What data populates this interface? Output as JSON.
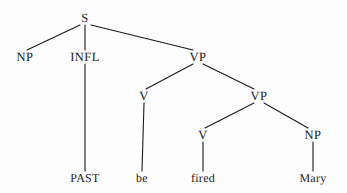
{
  "diagram": {
    "type": "syntax-tree",
    "canvas": {
      "width": 347,
      "height": 193,
      "background": "#fdfdfd"
    },
    "ink_color": "#1b1b1b",
    "nodes": [
      {
        "id": "s",
        "label": "S",
        "x": 85,
        "y": 18,
        "kind": "category"
      },
      {
        "id": "np1",
        "label": "NP",
        "x": 25,
        "y": 57,
        "kind": "category"
      },
      {
        "id": "infl",
        "label": "INFL",
        "x": 85,
        "y": 57,
        "kind": "category"
      },
      {
        "id": "vp1",
        "label": "VP",
        "x": 198,
        "y": 57,
        "kind": "category"
      },
      {
        "id": "v1",
        "label": "V",
        "x": 144,
        "y": 96,
        "kind": "category"
      },
      {
        "id": "vp2",
        "label": "VP",
        "x": 259,
        "y": 96,
        "kind": "category"
      },
      {
        "id": "v2",
        "label": "V",
        "x": 203,
        "y": 135,
        "kind": "category"
      },
      {
        "id": "np2",
        "label": "NP",
        "x": 313,
        "y": 135,
        "kind": "category"
      },
      {
        "id": "past",
        "label": "PAST",
        "x": 85,
        "y": 178,
        "kind": "terminal"
      },
      {
        "id": "be",
        "label": "be",
        "x": 142,
        "y": 178,
        "kind": "terminal"
      },
      {
        "id": "fired",
        "label": "fired",
        "x": 203,
        "y": 178,
        "kind": "terminal"
      },
      {
        "id": "mary",
        "label": "Mary",
        "x": 313,
        "y": 178,
        "kind": "terminal"
      }
    ],
    "edges": [
      {
        "from": "s",
        "to": "np1",
        "x1": 80,
        "y1": 25,
        "x2": 27,
        "y2": 50
      },
      {
        "from": "s",
        "to": "infl",
        "x1": 85,
        "y1": 25,
        "x2": 85,
        "y2": 50
      },
      {
        "from": "s",
        "to": "vp1",
        "x1": 91,
        "y1": 25,
        "x2": 193,
        "y2": 50
      },
      {
        "from": "infl",
        "to": "past",
        "x1": 85,
        "y1": 64,
        "x2": 85,
        "y2": 171
      },
      {
        "from": "vp1",
        "to": "v1",
        "x1": 193,
        "y1": 64,
        "x2": 146,
        "y2": 89
      },
      {
        "from": "vp1",
        "to": "vp2",
        "x1": 203,
        "y1": 64,
        "x2": 254,
        "y2": 89
      },
      {
        "from": "v1",
        "to": "be",
        "x1": 144,
        "y1": 103,
        "x2": 142,
        "y2": 171
      },
      {
        "from": "vp2",
        "to": "v2",
        "x1": 254,
        "y1": 103,
        "x2": 205,
        "y2": 128
      },
      {
        "from": "vp2",
        "to": "np2",
        "x1": 264,
        "y1": 103,
        "x2": 308,
        "y2": 128
      },
      {
        "from": "v2",
        "to": "fired",
        "x1": 203,
        "y1": 142,
        "x2": 203,
        "y2": 171
      },
      {
        "from": "np2",
        "to": "mary",
        "x1": 313,
        "y1": 142,
        "x2": 313,
        "y2": 171
      }
    ]
  }
}
